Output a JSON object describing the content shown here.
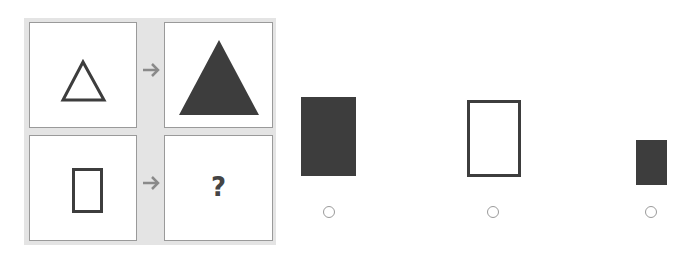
{
  "puzzle": {
    "question_mark": "?",
    "cells": [
      {
        "position": "top-left",
        "shape": "triangle",
        "style": "outline",
        "size": "small"
      },
      {
        "position": "top-right",
        "shape": "triangle",
        "style": "filled",
        "size": "large"
      },
      {
        "position": "bottom-left",
        "shape": "rectangle",
        "style": "outline",
        "size": "small"
      },
      {
        "position": "bottom-right",
        "shape": "unknown",
        "content": "?"
      }
    ],
    "arrows": [
      "arrow-right-icon",
      "arrow-right-icon"
    ]
  },
  "options": [
    {
      "shape": "rectangle",
      "style": "filled",
      "size": "large",
      "selected": false
    },
    {
      "shape": "rectangle",
      "style": "outline",
      "size": "large",
      "selected": false
    },
    {
      "shape": "rectangle",
      "style": "filled",
      "size": "small",
      "selected": false
    }
  ],
  "colors": {
    "shape": "#3d3d3d",
    "grid_bg": "#e4e4e4",
    "cell_border": "#9a9a9a",
    "arrow": "#8a8a8a",
    "radio_border": "#9a9a9a"
  }
}
